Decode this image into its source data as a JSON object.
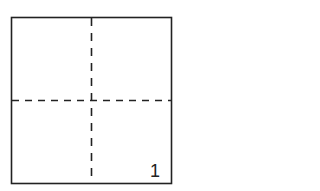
{
  "diagram": {
    "type": "folded-square",
    "label": "1",
    "colors": {
      "border": "#222222",
      "dash": "#222222",
      "background": "#ffffff"
    }
  }
}
